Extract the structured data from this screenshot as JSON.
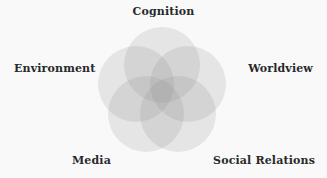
{
  "diagram": {
    "type": "venn-rosette",
    "title": "",
    "background_color": "#f9f9f9",
    "text_color": "#27292b",
    "circle_fill_color": "#8c8c8c",
    "circle_opacity": 0.18,
    "circle_count": 5,
    "circle_radius": 38,
    "ring_radius": 27,
    "center_x": 162,
    "center_y": 92,
    "sets": [
      {
        "id": "cognition",
        "label": "Cognition",
        "position": "top",
        "angle_deg": -90,
        "cx": 162,
        "cy": 65
      },
      {
        "id": "worldview",
        "label": "Worldview",
        "position": "upper-right",
        "angle_deg": -18,
        "cx": 188,
        "cy": 84
      },
      {
        "id": "social-relations",
        "label": "Social Relations",
        "position": "lower-right",
        "angle_deg": 54,
        "cx": 178,
        "cy": 114
      },
      {
        "id": "media",
        "label": "Media",
        "position": "lower-left",
        "angle_deg": 126,
        "cx": 146,
        "cy": 114
      },
      {
        "id": "environment",
        "label": "Environment",
        "position": "upper-left",
        "angle_deg": 198,
        "cx": 136,
        "cy": 84
      }
    ]
  },
  "chart_data": {
    "type": "venn",
    "title": "",
    "subtitle": "",
    "xlabel": "",
    "ylabel": "",
    "legend_position": "around-diagram",
    "grid": false,
    "categories": [
      "Cognition",
      "Worldview",
      "Social Relations",
      "Media",
      "Environment"
    ],
    "values": [
      1,
      1,
      1,
      1,
      1
    ],
    "annotations": [
      "Cognition",
      "Worldview",
      "Social Relations",
      "Media",
      "Environment"
    ]
  }
}
